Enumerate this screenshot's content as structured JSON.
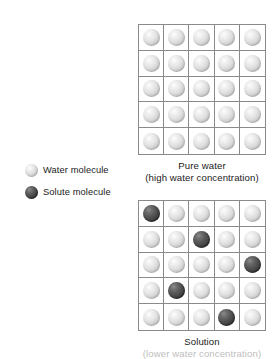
{
  "figure": {
    "title_alt": "Pure water and solution molecule diagram"
  },
  "legend": {
    "items": [
      {
        "icon": "water-molecule-sphere",
        "label": "Water molecule",
        "color": "#e2e2e2"
      },
      {
        "icon": "solute-molecule-sphere",
        "label": "Solute molecule",
        "color": "#454545"
      }
    ]
  },
  "panels": [
    {
      "id": "pure-water",
      "caption_lines": [
        "Pure water",
        "(high water concentration)"
      ],
      "grid": {
        "rows": 5,
        "cols": 5,
        "cells": [
          [
            "water",
            "water",
            "water",
            "water",
            "water"
          ],
          [
            "water",
            "water",
            "water",
            "water",
            "water"
          ],
          [
            "water",
            "water",
            "water",
            "water",
            "water"
          ],
          [
            "water",
            "water",
            "water",
            "water",
            "water"
          ],
          [
            "water",
            "water",
            "water",
            "water",
            "water"
          ]
        ]
      }
    },
    {
      "id": "solution",
      "caption_lines": [
        "Solution"
      ],
      "caption_clipped": "(lower water concentration)",
      "grid": {
        "rows": 5,
        "cols": 5,
        "cells": [
          [
            "solute",
            "water",
            "water",
            "water",
            "water"
          ],
          [
            "water",
            "water",
            "solute",
            "water",
            "water"
          ],
          [
            "water",
            "water",
            "water",
            "water",
            "solute"
          ],
          [
            "water",
            "solute",
            "water",
            "water",
            "water"
          ],
          [
            "water",
            "water",
            "water",
            "solute",
            "water"
          ]
        ]
      }
    }
  ],
  "colors": {
    "grid_line": "#8a8a8a",
    "text": "#1a1a1a",
    "background": "#ffffff"
  }
}
